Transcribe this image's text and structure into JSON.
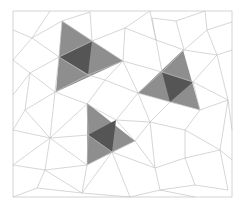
{
  "diagram": {
    "type": "triangular-mesh",
    "frame": {
      "x": 13,
      "y": 11,
      "width": 219,
      "height": 186
    },
    "colors": {
      "background": "#ffffff",
      "mesh_edge": "#c4c4c4",
      "frame": "#cfcfcf",
      "highlight_outer": "#8e8e8e",
      "highlight_inner": "#555555"
    },
    "edges": [
      [
        13,
        11,
        232,
        11
      ],
      [
        232,
        11,
        232,
        197
      ],
      [
        232,
        197,
        13,
        197
      ],
      [
        13,
        197,
        13,
        11
      ],
      [
        13,
        30,
        32,
        38
      ],
      [
        32,
        38,
        62,
        21
      ],
      [
        62,
        21,
        90,
        12
      ],
      [
        32,
        38,
        50,
        11
      ],
      [
        32,
        38,
        13,
        60
      ],
      [
        90,
        12,
        92,
        41
      ],
      [
        62,
        21,
        92,
        41
      ],
      [
        92,
        41,
        123,
        61
      ],
      [
        92,
        41,
        125,
        28
      ],
      [
        125,
        28,
        123,
        61
      ],
      [
        125,
        28,
        150,
        11
      ],
      [
        125,
        28,
        156,
        40
      ],
      [
        150,
        11,
        156,
        40
      ],
      [
        156,
        40,
        152,
        18
      ],
      [
        152,
        18,
        176,
        21
      ],
      [
        176,
        21,
        205,
        11
      ],
      [
        176,
        21,
        184,
        50
      ],
      [
        156,
        40,
        184,
        50
      ],
      [
        184,
        50,
        207,
        30
      ],
      [
        207,
        30,
        232,
        22
      ],
      [
        207,
        30,
        205,
        11
      ],
      [
        207,
        30,
        217,
        55
      ],
      [
        184,
        50,
        217,
        55
      ],
      [
        217,
        55,
        232,
        50
      ],
      [
        217,
        55,
        228,
        100
      ],
      [
        217,
        55,
        193,
        82
      ],
      [
        184,
        50,
        162,
        72
      ],
      [
        156,
        40,
        162,
        72
      ],
      [
        123,
        61,
        162,
        72
      ],
      [
        123,
        61,
        138,
        93
      ],
      [
        162,
        72,
        138,
        93
      ],
      [
        162,
        72,
        193,
        82
      ],
      [
        193,
        82,
        228,
        100
      ],
      [
        193,
        82,
        200,
        110
      ],
      [
        228,
        100,
        200,
        110
      ],
      [
        228,
        100,
        232,
        130
      ],
      [
        200,
        110,
        170,
        102
      ],
      [
        170,
        102,
        138,
        93
      ],
      [
        170,
        102,
        150,
        122
      ],
      [
        138,
        93,
        150,
        122
      ],
      [
        138,
        93,
        105,
        80
      ],
      [
        105,
        80,
        123,
        61
      ],
      [
        105,
        80,
        87,
        104
      ],
      [
        105,
        80,
        88,
        75
      ],
      [
        88,
        75,
        123,
        61
      ],
      [
        59,
        57,
        32,
        38
      ],
      [
        59,
        57,
        62,
        21
      ],
      [
        59,
        57,
        92,
        41
      ],
      [
        59,
        57,
        88,
        75
      ],
      [
        59,
        57,
        30,
        73
      ],
      [
        59,
        57,
        55,
        92
      ],
      [
        30,
        73,
        13,
        60
      ],
      [
        30,
        73,
        13,
        95
      ],
      [
        30,
        73,
        55,
        92
      ],
      [
        30,
        73,
        25,
        110
      ],
      [
        55,
        92,
        25,
        110
      ],
      [
        55,
        92,
        87,
        104
      ],
      [
        55,
        92,
        88,
        75
      ],
      [
        25,
        110,
        13,
        130
      ],
      [
        25,
        110,
        50,
        138
      ],
      [
        55,
        92,
        50,
        138
      ],
      [
        87,
        104,
        50,
        138
      ],
      [
        87,
        104,
        88,
        135
      ],
      [
        87,
        104,
        116,
        120
      ],
      [
        116,
        120,
        150,
        122
      ],
      [
        116,
        120,
        138,
        93
      ],
      [
        116,
        120,
        135,
        141
      ],
      [
        150,
        122,
        135,
        141
      ],
      [
        150,
        122,
        185,
        130
      ],
      [
        185,
        130,
        200,
        110
      ],
      [
        185,
        130,
        220,
        150
      ],
      [
        220,
        150,
        228,
        100
      ],
      [
        220,
        150,
        232,
        160
      ],
      [
        150,
        122,
        155,
        168
      ],
      [
        135,
        141,
        155,
        168
      ],
      [
        185,
        130,
        185,
        158
      ],
      [
        155,
        168,
        185,
        158
      ],
      [
        185,
        158,
        220,
        150
      ],
      [
        185,
        158,
        195,
        185
      ],
      [
        220,
        150,
        228,
        190
      ],
      [
        195,
        185,
        228,
        190
      ],
      [
        195,
        185,
        160,
        190
      ],
      [
        160,
        190,
        155,
        168
      ],
      [
        155,
        168,
        112,
        152
      ],
      [
        135,
        141,
        112,
        152
      ],
      [
        112,
        152,
        88,
        135
      ],
      [
        88,
        135,
        50,
        138
      ],
      [
        88,
        135,
        87,
        165
      ],
      [
        112,
        152,
        87,
        165
      ],
      [
        87,
        165,
        50,
        138
      ],
      [
        87,
        165,
        45,
        170
      ],
      [
        50,
        138,
        45,
        170
      ],
      [
        45,
        170,
        13,
        165
      ],
      [
        45,
        170,
        37,
        188
      ],
      [
        37,
        188,
        13,
        197
      ],
      [
        37,
        188,
        82,
        193
      ],
      [
        87,
        165,
        82,
        193
      ],
      [
        82,
        193,
        112,
        152
      ],
      [
        82,
        193,
        130,
        197
      ],
      [
        130,
        197,
        112,
        152
      ],
      [
        130,
        197,
        160,
        190
      ],
      [
        160,
        190,
        195,
        197
      ],
      [
        45,
        170,
        82,
        193
      ],
      [
        13,
        130,
        50,
        138
      ],
      [
        13,
        165,
        50,
        138
      ]
    ],
    "highlighted_triangles": [
      {
        "name": "highlight-upper-left",
        "outer": [
          [
            62,
            21
          ],
          [
            123,
            61
          ],
          [
            56,
            92
          ]
        ],
        "inner": [
          [
            59,
            57
          ],
          [
            92,
            41
          ],
          [
            88,
            74
          ]
        ]
      },
      {
        "name": "highlight-right",
        "outer": [
          [
            183,
            50
          ],
          [
            200,
            110
          ],
          [
            138,
            93
          ]
        ],
        "inner": [
          [
            162,
            72
          ],
          [
            193,
            82
          ],
          [
            170,
            102
          ]
        ]
      },
      {
        "name": "highlight-lower",
        "outer": [
          [
            87,
            103
          ],
          [
            135,
            141
          ],
          [
            87,
            165
          ]
        ],
        "inner": [
          [
            88,
            135
          ],
          [
            116,
            120
          ],
          [
            112,
            152
          ]
        ]
      }
    ]
  }
}
